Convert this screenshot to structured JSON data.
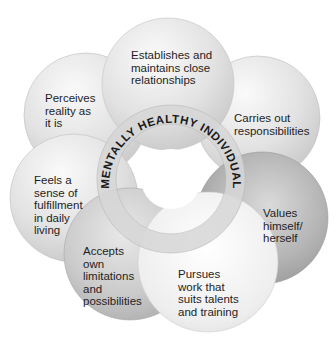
{
  "diagram": {
    "center_label": "MENTALLY HEALTHY INDIVIDUAL",
    "traits": [
      {
        "id": "relationships",
        "label": "Establishes and\nmaintains close\nrelationships"
      },
      {
        "id": "reality",
        "label": "Perceives\nreality as\nit is"
      },
      {
        "id": "responsibilities",
        "label": "Carries out\nresponsibilities"
      },
      {
        "id": "fulfillment",
        "label": "Feels a\nsense of\nfulfillment\nin daily\nliving"
      },
      {
        "id": "values",
        "label": "Values\nhimself/\nherself"
      },
      {
        "id": "limitations",
        "label": "Accepts\nown\nlimitations\nand\npossibilities"
      },
      {
        "id": "work",
        "label": "Pursues\nwork that\nsuits talents\nand training"
      }
    ]
  },
  "colors": {
    "background": "#ffffff",
    "text": "#1e1e1e",
    "ring": "#d6d6d6"
  }
}
